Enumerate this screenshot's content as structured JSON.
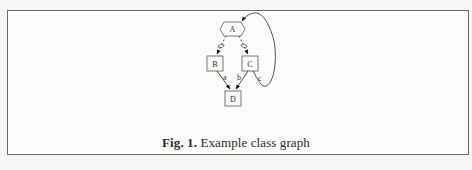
{
  "figure": {
    "caption_prefix": "Fig. 1.",
    "caption_text": "Example class graph"
  },
  "graph": {
    "nodes": [
      {
        "id": "A",
        "label": "A",
        "shape": "hexagon"
      },
      {
        "id": "B",
        "label": "B",
        "shape": "box"
      },
      {
        "id": "C",
        "label": "C",
        "shape": "box"
      },
      {
        "id": "D",
        "label": "D",
        "shape": "box"
      }
    ],
    "edges": [
      {
        "from": "A",
        "to": "B",
        "style": "dashed",
        "label": "",
        "marker": "diamond-open"
      },
      {
        "from": "A",
        "to": "C",
        "style": "dashed",
        "label": "",
        "marker": "diamond-open"
      },
      {
        "from": "B",
        "to": "D",
        "style": "solid",
        "label": "a"
      },
      {
        "from": "C",
        "to": "D",
        "style": "solid",
        "label": "b"
      },
      {
        "from": "C",
        "to": "A",
        "style": "solid",
        "label": "c"
      }
    ]
  }
}
